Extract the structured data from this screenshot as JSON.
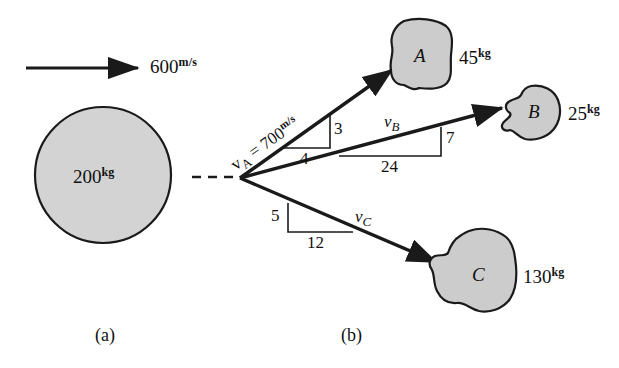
{
  "figure": {
    "type": "physics-diagram",
    "colors": {
      "body_fill": "#d3d3d3",
      "fragment_fill": "#cccccc",
      "stroke": "#1a1a1a",
      "background": "#ffffff"
    }
  },
  "panel_a": {
    "caption": "(a)",
    "velocity_arrow": {
      "value": "600",
      "unit": "m/s"
    },
    "body": {
      "mass": "200",
      "unit": "kg"
    }
  },
  "panel_b": {
    "caption": "(b)",
    "fragments": [
      {
        "letter": "A",
        "mass": "45",
        "unit": "kg",
        "velocity_label": "v",
        "velocity_sub": "A",
        "velocity_eq": "= 700",
        "velocity_unit": "m/s",
        "slope_rise": "3",
        "slope_run": "4"
      },
      {
        "letter": "B",
        "mass": "25",
        "unit": "kg",
        "velocity_label": "v",
        "velocity_sub": "B",
        "slope_rise": "7",
        "slope_run": "24"
      },
      {
        "letter": "C",
        "mass": "130",
        "unit": "kg",
        "velocity_label": "v",
        "velocity_sub": "C",
        "slope_rise": "5",
        "slope_run": "12"
      }
    ]
  }
}
